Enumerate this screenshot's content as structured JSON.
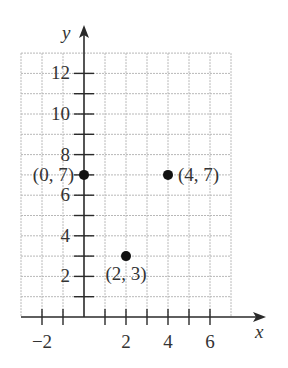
{
  "chart_data": {
    "type": "scatter",
    "title": "",
    "xlabel": "x",
    "ylabel": "y",
    "xlim": [
      -3,
      7
    ],
    "ylim": [
      0,
      13
    ],
    "grid": true,
    "x_tick_labels": [
      "−2",
      "2",
      "4",
      "6"
    ],
    "x_tick_values": [
      -2,
      2,
      4,
      6
    ],
    "y_tick_labels": [
      "2",
      "4",
      "6",
      "8",
      "10",
      "12"
    ],
    "y_tick_values": [
      2,
      4,
      6,
      8,
      10,
      12
    ],
    "points": [
      {
        "x": 0,
        "y": 7,
        "label": "(0, 7)"
      },
      {
        "x": 4,
        "y": 7,
        "label": "(4, 7)"
      },
      {
        "x": 2,
        "y": 3,
        "label": "(2, 3)"
      }
    ],
    "colors": {
      "point": "#111111",
      "axis": "#2a2a2a",
      "grid": "#b8b8b8"
    }
  }
}
